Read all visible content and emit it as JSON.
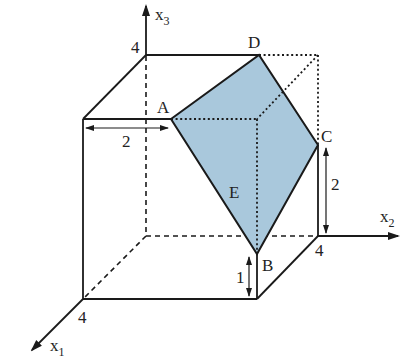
{
  "diagram": {
    "type": "3d-cube-with-plane-section",
    "colors": {
      "plane_fill": "#a9c8dc",
      "lines": "#1a1a1a",
      "background": "#ffffff"
    },
    "axes": {
      "x1": {
        "label": "x",
        "subscript": "1",
        "tick": "4"
      },
      "x2": {
        "label": "x",
        "subscript": "2",
        "tick": "4"
      },
      "x3": {
        "label": "x",
        "subscript": "3",
        "tick": "4"
      }
    },
    "points": {
      "A": "A",
      "B": "B",
      "C": "C",
      "D": "D"
    },
    "plane_label": "E",
    "dimensions": {
      "top_left_to_A": "2",
      "C_height": "2",
      "B_height": "1"
    }
  }
}
